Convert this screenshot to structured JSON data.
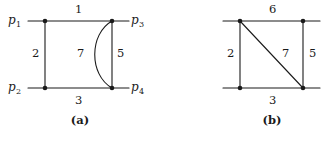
{
  "figure": {
    "background_color": "#ffffff",
    "stroke_color": "#1a1a1a",
    "text_color": "#1a1a1a",
    "panels": [
      {
        "id": "panel-a",
        "caption": "(a)",
        "caption_x": 80,
        "caption_y": 122,
        "graph_type": "multigraph",
        "vertices": [
          {
            "id": "p1",
            "label": "p",
            "subscript": "1",
            "x": 45,
            "y": 21,
            "label_x": 14,
            "label_y": 21,
            "label_anchor": "left"
          },
          {
            "id": "p3",
            "label": "p",
            "subscript": "3",
            "x": 112,
            "y": 21,
            "label_x": 133,
            "label_y": 21,
            "label_anchor": "left"
          },
          {
            "id": "p2",
            "label": "p",
            "subscript": "2",
            "x": 45,
            "y": 88,
            "label_x": 14,
            "label_y": 88,
            "label_anchor": "left"
          },
          {
            "id": "p4",
            "label": "p",
            "subscript": "4",
            "x": 112,
            "y": 88,
            "label_x": 133,
            "label_y": 88,
            "label_anchor": "left"
          }
        ],
        "edges": [
          {
            "id": "a-e1",
            "weight": "1",
            "from": "p1",
            "to": "p3",
            "shape": "line",
            "label_x": 78,
            "label_y": 10
          },
          {
            "id": "a-e2",
            "weight": "2",
            "from": "p1",
            "to": "p2",
            "shape": "line",
            "label_x": 35,
            "label_y": 54
          },
          {
            "id": "a-e3",
            "weight": "3",
            "from": "p2",
            "to": "p4",
            "shape": "line",
            "label_x": 78,
            "label_y": 101
          },
          {
            "id": "a-e5",
            "weight": "5",
            "from": "p3",
            "to": "p4",
            "shape": "line",
            "label_x": 120,
            "label_y": 54
          },
          {
            "id": "a-e7",
            "weight": "7",
            "from": "p3",
            "to": "p4",
            "shape": "curve-left",
            "label_x": 80,
            "label_y": 54
          }
        ],
        "leader_lines": [
          {
            "id": "a-lead-p1",
            "x1": 28,
            "y1": 21,
            "x2": 45,
            "y2": 21
          },
          {
            "id": "a-lead-p3",
            "x1": 112,
            "y1": 21,
            "x2": 129,
            "y2": 21
          },
          {
            "id": "a-lead-p2",
            "x1": 28,
            "y1": 88,
            "x2": 45,
            "y2": 88
          },
          {
            "id": "a-lead-p4",
            "x1": 112,
            "y1": 88,
            "x2": 129,
            "y2": 88
          }
        ]
      },
      {
        "id": "panel-b",
        "caption": "(b)",
        "caption_x": 272,
        "caption_y": 122,
        "graph_type": "simple-graph",
        "vertices": [
          {
            "id": "b-tl",
            "label": "",
            "subscript": "",
            "x": 240,
            "y": 21
          },
          {
            "id": "b-tr",
            "label": "",
            "subscript": "",
            "x": 303,
            "y": 21
          },
          {
            "id": "b-bl",
            "label": "",
            "subscript": "",
            "x": 240,
            "y": 88
          },
          {
            "id": "b-br",
            "label": "",
            "subscript": "",
            "x": 303,
            "y": 88
          }
        ],
        "edges": [
          {
            "id": "b-e6",
            "weight": "6",
            "from": "b-tl",
            "to": "b-tr",
            "shape": "line",
            "label_x": 272,
            "label_y": 10
          },
          {
            "id": "b-e2",
            "weight": "2",
            "from": "b-tl",
            "to": "b-bl",
            "shape": "line",
            "label_x": 230,
            "label_y": 54
          },
          {
            "id": "b-e3",
            "weight": "3",
            "from": "b-bl",
            "to": "b-br",
            "shape": "line",
            "label_x": 272,
            "label_y": 101
          },
          {
            "id": "b-e5",
            "weight": "5",
            "from": "b-tr",
            "to": "b-br",
            "shape": "line",
            "label_x": 312,
            "label_y": 54
          },
          {
            "id": "b-e7",
            "weight": "7",
            "from": "b-tl",
            "to": "b-br",
            "shape": "diagonal",
            "label_x": 285,
            "label_y": 54
          }
        ],
        "leader_lines": [
          {
            "id": "b-lead-tl",
            "x1": 223,
            "y1": 21,
            "x2": 240,
            "y2": 21
          },
          {
            "id": "b-lead-tr",
            "x1": 303,
            "y1": 21,
            "x2": 320,
            "y2": 21
          },
          {
            "id": "b-lead-bl",
            "x1": 223,
            "y1": 88,
            "x2": 240,
            "y2": 88
          },
          {
            "id": "b-lead-br",
            "x1": 303,
            "y1": 88,
            "x2": 320,
            "y2": 88
          }
        ]
      }
    ]
  }
}
